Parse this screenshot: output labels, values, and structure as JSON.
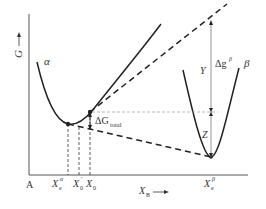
{
  "diagram": {
    "axis_y_label": "G",
    "axis_x_label": "X",
    "axis_x_label_sub": "B",
    "origin_label": "A",
    "curve_labels": {
      "alpha": "α",
      "beta": "β"
    },
    "x_ticks": [
      {
        "main": "X",
        "sub": "e",
        "sup": "α"
      },
      {
        "main": "X",
        "sub": "0",
        "sup": "′"
      },
      {
        "main": "X",
        "sub": "0",
        "sup": ""
      },
      {
        "main": "X",
        "sub": "e",
        "sup": "β"
      }
    ],
    "annotations": {
      "delta_g_total": {
        "main": "ΔG",
        "sub": "total"
      },
      "delta_g_beta": {
        "main": "Δg",
        "sup": "β"
      },
      "Y": "Y",
      "Z": "Z"
    },
    "colors": {
      "line": "#222222",
      "thin_dashed": "#888888",
      "text": "#333333"
    }
  }
}
